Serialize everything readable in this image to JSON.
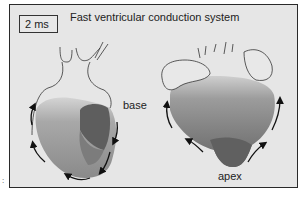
{
  "figure": {
    "title": "Fast ventricular conduction system",
    "time_label": "2 ms",
    "labels": {
      "base": "base",
      "apex": "apex"
    },
    "panel_mark": ":",
    "colors": {
      "panel_bg": "#e6e6e6",
      "early_activation": "#5a5a5a",
      "mid_activation": "#8a8a8a",
      "late_activation": "#c4c4c4",
      "outline": "#333333"
    },
    "views": [
      {
        "name": "left-heart-view",
        "arrows": "clockwise-around-left-heart"
      },
      {
        "name": "right-heart-view",
        "arrows": "apex-to-base"
      }
    ]
  }
}
